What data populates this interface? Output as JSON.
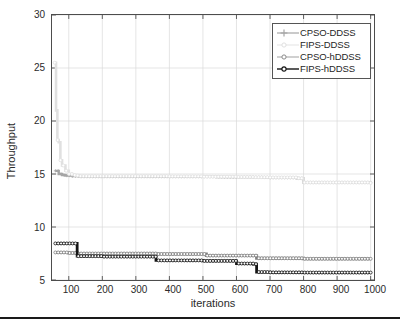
{
  "chart_data": {
    "type": "line",
    "title": "",
    "xlabel": "iterations",
    "ylabel": "Throughput",
    "xlim": [
      50,
      1010
    ],
    "ylim": [
      5,
      30
    ],
    "xticks": [
      100,
      200,
      300,
      400,
      500,
      600,
      700,
      800,
      900,
      1000
    ],
    "yticks": [
      5,
      10,
      15,
      20,
      25,
      30
    ],
    "grid": true,
    "legend_position": "top-right",
    "series": [
      {
        "name": "CPSO-DDSS",
        "color": "#a6a6a6",
        "marker": "plus",
        "x": [
          60,
          70,
          80,
          90,
          100,
          110,
          120,
          130,
          160,
          200,
          250,
          300,
          350,
          400,
          450,
          500,
          540,
          560,
          600,
          640,
          660,
          680,
          700,
          780,
          800,
          900,
          1000
        ],
        "y": [
          15.3,
          15.0,
          14.9,
          14.85,
          14.85,
          14.8,
          14.8,
          14.75,
          14.75,
          14.75,
          14.75,
          14.75,
          14.75,
          14.75,
          14.75,
          14.75,
          14.72,
          14.7,
          14.7,
          14.7,
          14.7,
          14.68,
          14.65,
          14.6,
          14.2,
          14.2,
          14.15
        ]
      },
      {
        "name": "FIPS-DDSS",
        "color": "#e0e0e0",
        "marker": "circle",
        "x": [
          58,
          62,
          66,
          70,
          75,
          80,
          90,
          100,
          110,
          120,
          130,
          160,
          200,
          250,
          300,
          350,
          400,
          450,
          500,
          550,
          600,
          650,
          680,
          700,
          780,
          800,
          900,
          1000
        ],
        "y": [
          25.5,
          21.0,
          18.2,
          18.0,
          16.3,
          15.8,
          15.3,
          15.0,
          14.9,
          14.85,
          14.8,
          14.8,
          14.8,
          14.8,
          14.8,
          14.8,
          14.78,
          14.78,
          14.75,
          14.75,
          14.72,
          14.7,
          14.7,
          14.68,
          14.6,
          14.2,
          14.2,
          14.15
        ]
      },
      {
        "name": "CPSO-hDDSS",
        "color": "#808080",
        "marker": "circle",
        "x": [
          60,
          80,
          100,
          120,
          125,
          160,
          200,
          250,
          300,
          350,
          360,
          400,
          450,
          500,
          510,
          550,
          600,
          650,
          660,
          680,
          700,
          780,
          800,
          900,
          1000
        ],
        "y": [
          7.6,
          7.6,
          7.55,
          7.55,
          7.5,
          7.5,
          7.5,
          7.5,
          7.5,
          7.5,
          7.45,
          7.45,
          7.45,
          7.45,
          7.3,
          7.3,
          7.3,
          7.3,
          7.05,
          7.05,
          7.05,
          7.05,
          7.0,
          7.0,
          7.0
        ]
      },
      {
        "name": "FIPS-hDDSS",
        "color": "#141414",
        "marker": "circle",
        "x": [
          60,
          80,
          100,
          120,
          125,
          160,
          200,
          250,
          300,
          350,
          360,
          400,
          450,
          500,
          550,
          595,
          600,
          650,
          655,
          660,
          700,
          780,
          800,
          900,
          1000
        ],
        "y": [
          8.45,
          8.45,
          8.45,
          8.45,
          7.25,
          7.25,
          7.2,
          7.2,
          7.2,
          7.2,
          6.85,
          6.85,
          6.85,
          6.8,
          6.8,
          6.8,
          6.55,
          6.5,
          6.5,
          5.75,
          5.72,
          5.72,
          5.7,
          5.7,
          5.7
        ]
      }
    ]
  },
  "axes": {
    "ylabel": "Throughput",
    "xlabel": "iterations",
    "yticks": [
      "30",
      "25",
      "20",
      "15",
      "10",
      "5"
    ],
    "xticks": [
      "100",
      "200",
      "300",
      "400",
      "500",
      "600",
      "700",
      "800",
      "900",
      "1000"
    ]
  },
  "legend": {
    "items": [
      {
        "label": "CPSO-DDSS",
        "color": "#a6a6a6",
        "marker": "plus-marker"
      },
      {
        "label": "FIPS-DDSS",
        "color": "#e6e6e6",
        "marker": "circle-marker"
      },
      {
        "label": "CPSO-hDDSS",
        "color": "#949494",
        "marker": "circle-marker"
      },
      {
        "label": "FIPS-hDDSS",
        "color": "#141414",
        "marker": "circle-marker"
      }
    ]
  }
}
